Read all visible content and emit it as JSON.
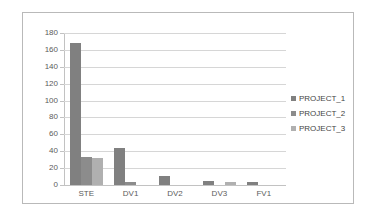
{
  "chart_data": {
    "type": "bar",
    "title": "",
    "subtitle": "",
    "xlabel": "",
    "ylabel": "",
    "categories": [
      "STE",
      "DV1",
      "DV2",
      "DV3",
      "FV1"
    ],
    "series": [
      {
        "name": "PROJECT_1",
        "color": "#808080",
        "values": [
          168,
          44,
          11,
          5,
          4
        ]
      },
      {
        "name": "PROJECT_2",
        "color": "#8c8c8c",
        "values": [
          33,
          3,
          0,
          0,
          0
        ]
      },
      {
        "name": "PROJECT_3",
        "color": "#b0b0b0",
        "values": [
          32,
          0,
          0,
          3,
          0
        ]
      }
    ],
    "ylim": [
      0,
      180
    ],
    "ytick_values": [
      0,
      20,
      40,
      60,
      80,
      100,
      120,
      140,
      160,
      180
    ],
    "ytick_labels": [
      "0",
      "20",
      "40",
      "60",
      "80",
      "100",
      "120",
      "140",
      "160",
      "180"
    ],
    "grid": true,
    "legend_position": "right"
  },
  "legend": {
    "items": [
      {
        "label": "PROJECT_1",
        "swatch": "legend-swatch-project-1"
      },
      {
        "label": "PROJECT_2",
        "swatch": "legend-swatch-project-2"
      },
      {
        "label": "PROJECT_3",
        "swatch": "legend-swatch-project-3"
      }
    ]
  }
}
